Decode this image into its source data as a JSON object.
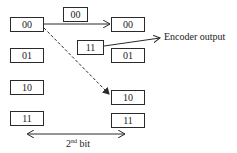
{
  "diagram": {
    "left_states": [
      {
        "label": "00",
        "x": 10,
        "y": 17,
        "w": 34,
        "h": 15
      },
      {
        "label": "01",
        "x": 10,
        "y": 48,
        "w": 34,
        "h": 15
      },
      {
        "label": "10",
        "x": 10,
        "y": 80,
        "w": 34,
        "h": 15
      },
      {
        "label": "11",
        "x": 10,
        "y": 111,
        "w": 34,
        "h": 15
      }
    ],
    "right_states": [
      {
        "label": "00",
        "x": 111,
        "y": 17,
        "w": 34,
        "h": 15
      },
      {
        "label": "01",
        "x": 111,
        "y": 48,
        "w": 34,
        "h": 15
      },
      {
        "label": "10",
        "x": 111,
        "y": 90,
        "w": 34,
        "h": 15
      },
      {
        "label": "11",
        "x": 111,
        "y": 113,
        "w": 34,
        "h": 15
      }
    ],
    "transition_labels": [
      {
        "label": "00",
        "x": 63,
        "y": 7,
        "w": 25,
        "h": 15
      },
      {
        "label": "11",
        "x": 77,
        "y": 40,
        "w": 27,
        "h": 15
      }
    ],
    "encoder_output_label": "Encoder output",
    "bit_label_main": "2",
    "bit_label_sup": "nd",
    "bit_label_rest": " bit",
    "colors": {
      "line": "#2a2a2a",
      "background": "#ffffff"
    }
  }
}
